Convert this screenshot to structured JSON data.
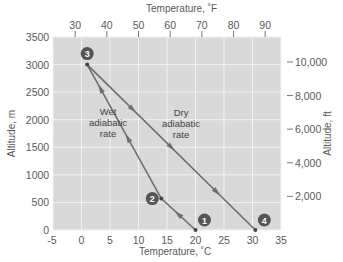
{
  "chart_data": {
    "type": "line",
    "title": "",
    "xlabel": "Temperature, °C",
    "ylabel": "Altitude, m",
    "x2label": "Temperature, °F",
    "y2label": "Altitude, ft",
    "xlim": [
      -5,
      35
    ],
    "ylim": [
      0,
      3500
    ],
    "x_ticks": [
      "-5",
      "0",
      "5",
      "10",
      "15",
      "20",
      "25",
      "30",
      "35"
    ],
    "y_ticks": [
      "0",
      "500",
      "1000",
      "1500",
      "2000",
      "2500",
      "3000",
      "3500"
    ],
    "x2_ticks": [
      "30",
      "40",
      "50",
      "60",
      "70",
      "80",
      "90"
    ],
    "y2_ticks": [
      "2,000",
      "4,000",
      "6,000",
      "8,000",
      "10,000"
    ],
    "grid": true,
    "points": [
      {
        "label": "1",
        "x": 20,
        "y": 0
      },
      {
        "label": "2",
        "x": 14,
        "y": 570
      },
      {
        "label": "3",
        "x": 1,
        "y": 3000
      },
      {
        "label": "4",
        "x": 30.5,
        "y": 0
      }
    ],
    "series": [
      {
        "name": "Wet adiabatic rate",
        "x": [
          20,
          14,
          1
        ],
        "y": [
          0,
          570,
          3000
        ],
        "direction": "upward"
      },
      {
        "name": "Dry adiabatic rate",
        "x": [
          1,
          30.5
        ],
        "y": [
          3000,
          0
        ],
        "direction": "downward"
      }
    ],
    "annotations": [
      {
        "text": "Wet adiabatic rate",
        "x": 7.5,
        "y": 1700
      },
      {
        "text": "Dry adiabatic rate",
        "x": 20,
        "y": 2100
      }
    ]
  },
  "labels": {
    "top_axis_title": "Temperature, ˚F",
    "bottom_axis_title": "Temperature, ˚C",
    "left_axis_title": "Altitude, m",
    "right_axis_title": "Altitude, ft",
    "wet": [
      "Wet",
      "adiabatic",
      "rate"
    ],
    "dry": [
      "Dry",
      "adiabatic",
      "rate"
    ],
    "markers": [
      "1",
      "2",
      "3",
      "4"
    ]
  },
  "colors": {
    "plot_bg": "#d9d9d9",
    "grid": "#f2f2f2",
    "line": "#6e6e6e",
    "marker": "#555555"
  }
}
